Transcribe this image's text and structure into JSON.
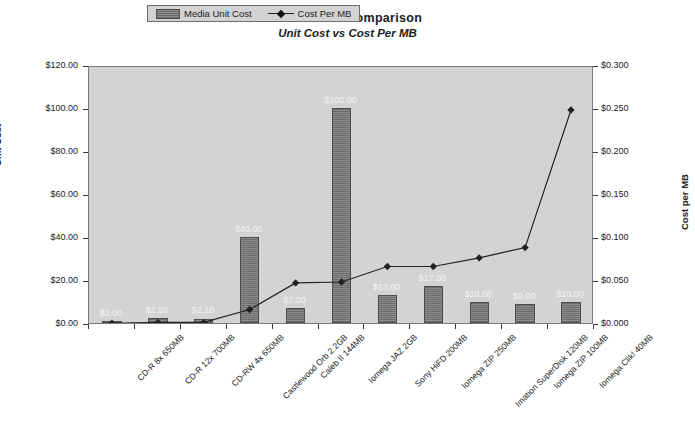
{
  "chart_data": {
    "type": "bar",
    "title": "Media Cost Comparison",
    "subtitle": "Unit Cost vs Cost Per MB",
    "xlabel": "",
    "ylabel": "Unit Cost",
    "y2label": "Cost per MB",
    "ylim": [
      0,
      120
    ],
    "y2lim": [
      0,
      0.3
    ],
    "grid": false,
    "legend_position": "top-center",
    "categories": [
      "CD-R 8x 650MB",
      "CD-R 12x 700MB",
      "CD-RW 4x 650MB",
      "Castlewood Orb 2.2GB",
      "Caleb II 144MB",
      "Iomega JAZ 2GB",
      "Sony HiFD 200MB",
      "Iomega ZIP 250MB",
      "Imation SuperDisk 120MB",
      "Iomega ZIP 100MB",
      "Iomega Clik! 40MB"
    ],
    "series": [
      {
        "name": "Media Unit Cost",
        "type": "bar",
        "axis": "left",
        "values": [
          1.0,
          2.2,
          2.1,
          40.0,
          7.0,
          100.0,
          13.0,
          17.0,
          10.0,
          9.0,
          10.0
        ],
        "data_labels": [
          "$1.00",
          "$2.20",
          "$2.10",
          "$40.00",
          "$7.00",
          "$100.00",
          "$13.00",
          "$17.00",
          "$10.00",
          "$9.00",
          "$10.00"
        ],
        "color": "#7d7d7d"
      },
      {
        "name": "Cost Per MB",
        "type": "line",
        "axis": "right",
        "values": [
          0.002,
          0.003,
          0.003,
          0.018,
          0.049,
          0.05,
          0.068,
          0.068,
          0.078,
          0.09,
          0.25
        ],
        "color": "#222222"
      }
    ],
    "y_ticks": [
      "$0.00",
      "$20.00",
      "$40.00",
      "$60.00",
      "$80.00",
      "$100.00",
      "$120.00"
    ],
    "y2_ticks": [
      "$0.000",
      "$0.050",
      "$0.100",
      "$0.150",
      "$0.200",
      "$0.250",
      "$0.300"
    ],
    "legend_entries": [
      "Media Unit Cost",
      "Cost Per MB"
    ]
  }
}
